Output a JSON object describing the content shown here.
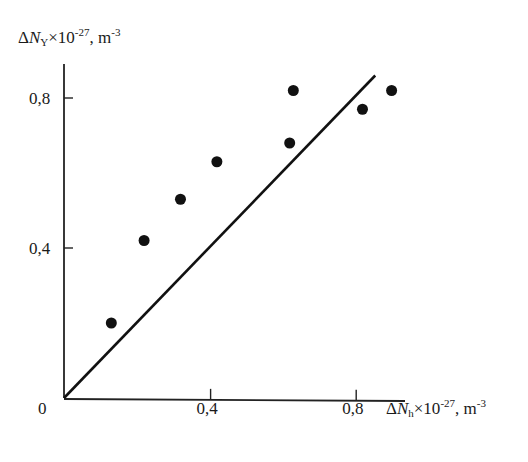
{
  "chart_data": {
    "type": "scatter",
    "title": "",
    "xlabel": "ΔNh×10^-27, m^-3",
    "ylabel": "ΔNY×10^-27, m^-3",
    "xlabel_parts": {
      "delta": "Δ",
      "var": "N",
      "sub": "h",
      "times": "×10",
      "exp": "-27",
      "unit": ", m",
      "unit_exp": "-3"
    },
    "ylabel_parts": {
      "delta": "Δ",
      "var": "N",
      "sub": "Y",
      "times": "×10",
      "exp": "-27",
      "unit": ", m",
      "unit_exp": "-3"
    },
    "xlim": [
      0,
      0.93
    ],
    "ylim": [
      0,
      0.9
    ],
    "origin_label": "0",
    "x_ticks": [
      {
        "value": 0.4,
        "label": "0,4"
      },
      {
        "value": 0.8,
        "label": "0,8"
      }
    ],
    "y_ticks": [
      {
        "value": 0.4,
        "label": "0,4"
      },
      {
        "value": 0.8,
        "label": "0,8"
      }
    ],
    "grid": false,
    "legend": null,
    "series": [
      {
        "name": "measured",
        "type": "scatter",
        "marker": "filled-circle",
        "x": [
          0.13,
          0.22,
          0.32,
          0.42,
          0.62,
          0.63,
          0.82,
          0.9
        ],
        "y": [
          0.2,
          0.42,
          0.53,
          0.63,
          0.68,
          0.82,
          0.77,
          0.82
        ]
      },
      {
        "name": "line y = x",
        "type": "line",
        "x": [
          0,
          0.855
        ],
        "y": [
          0,
          0.86
        ]
      }
    ]
  }
}
